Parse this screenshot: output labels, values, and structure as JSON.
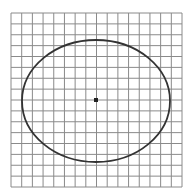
{
  "diagram": {
    "type": "ellipse-on-grid",
    "grid": {
      "columns": 16,
      "rows": 16,
      "x0": 11,
      "y0": 13,
      "x1": 182,
      "y1": 187,
      "line_color": "#8a8a8a"
    },
    "ellipse": {
      "cx": 96,
      "cy": 101,
      "rx": 74,
      "ry": 61,
      "stroke": "#333333",
      "stroke_width": 1.8
    },
    "center_marker": {
      "x": 96,
      "y": 100,
      "size": 4,
      "color": "#222222"
    },
    "background": "#ffffff"
  }
}
